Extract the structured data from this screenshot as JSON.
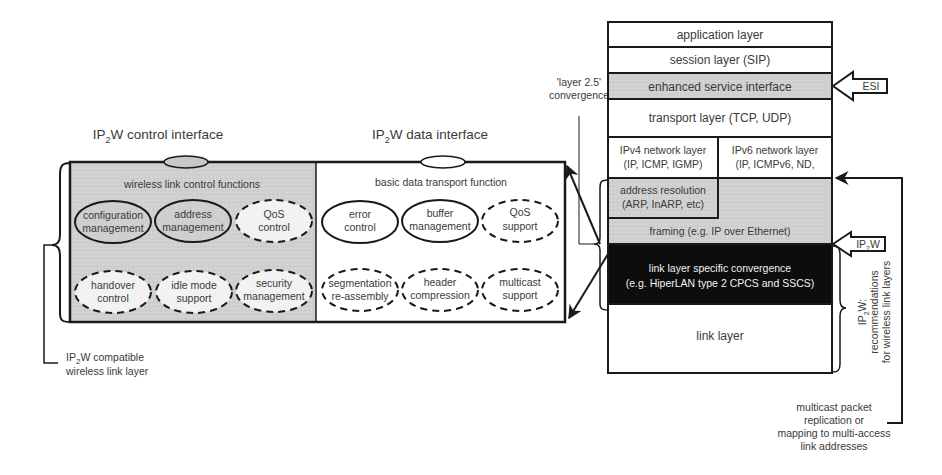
{
  "control_interface": {
    "title_prefix": "IP",
    "title_sub": "2",
    "title_suffix": "W control interface",
    "heading": "wireless link control functions",
    "functions": [
      {
        "line1": "configuration",
        "line2": "management",
        "style": "solid"
      },
      {
        "line1": "address",
        "line2": "management",
        "style": "solid"
      },
      {
        "line1": "QoS",
        "line2": "control",
        "style": "dashed"
      },
      {
        "line1": "handover",
        "line2": "control",
        "style": "dashed"
      },
      {
        "line1": "idle mode",
        "line2": "support",
        "style": "dashed"
      },
      {
        "line1": "security",
        "line2": "management",
        "style": "dashed"
      }
    ]
  },
  "data_interface": {
    "title_prefix": "IP",
    "title_sub": "2",
    "title_suffix": "W data interface",
    "heading": "basic data transport function",
    "functions": [
      {
        "line1": "error",
        "line2": "control",
        "style": "solid"
      },
      {
        "line1": "buffer",
        "line2": "management",
        "style": "solid"
      },
      {
        "line1": "QoS",
        "line2": "support",
        "style": "dashed"
      },
      {
        "line1": "segmentation",
        "line2": "re-assembly",
        "style": "dashed"
      },
      {
        "line1": "header",
        "line2": "compression",
        "style": "dashed"
      },
      {
        "line1": "multicast",
        "line2": "support",
        "style": "dashed"
      }
    ]
  },
  "compatible_label": {
    "line1_prefix": "IP",
    "line1_sub": "2",
    "line1_suffix": "W compatible",
    "line2": "wireless link layer"
  },
  "convergence_label": {
    "line1": "'layer 2.5'",
    "line2": "convergence"
  },
  "stack": {
    "application": "application layer",
    "session": "session layer (SIP)",
    "esi": "enhanced service interface",
    "transport": "transport layer (TCP, UDP)",
    "ipv4_line1": "IPv4 network layer",
    "ipv4_line2": "(IP, ICMP, IGMP)",
    "ipv6_line1": "IPv6 network layer",
    "ipv6_line2": "(IP, ICMPv6, ND,",
    "addr_line1": "address resolution",
    "addr_line2": "(ARP, InARP, etc)",
    "framing": "framing (e.g. IP over Ethernet)",
    "llsc_line1": "link layer specific convergence",
    "llsc_line2": "(e.g. HiperLAN type 2 CPCS and SSCS)",
    "link": "link layer"
  },
  "arrows": {
    "esi": "ESI",
    "ip2w_prefix": "IP",
    "ip2w_sub": "2",
    "ip2w_suffix": "W"
  },
  "recommendations": {
    "line1_prefix": "IP",
    "line1_sub": "2",
    "line1_suffix": "W:",
    "line2": "recommendations",
    "line3": "for wireless link layers"
  },
  "multicast_note": {
    "line1": "multicast packet",
    "line2": "replication or",
    "line3": "mapping to multi-access",
    "line4": "link addresses"
  },
  "colors": {
    "gray_fill": "#cfcfcf",
    "black_fill": "#0d0d0d",
    "stroke": "#1a1a1a",
    "text": "#3a3a3a"
  }
}
